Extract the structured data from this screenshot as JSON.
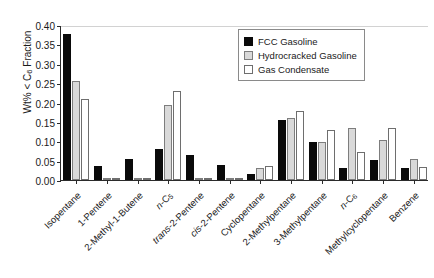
{
  "chart_data": {
    "type": "bar",
    "title": "",
    "xlabel": "",
    "ylabel": "Wt% < C6 Fraction",
    "ylabel_prefix": "Wt% < C",
    "ylabel_sub": "6",
    "ylabel_suffix": " Fraction",
    "ylim": [
      0.0,
      0.4
    ],
    "ytick_labels": [
      "0.00",
      "0.05",
      "0.10",
      "0.15",
      "0.20",
      "0.25",
      "0.30",
      "0.35",
      "0.40"
    ],
    "ytick_values": [
      0.0,
      0.05,
      0.1,
      0.15,
      0.2,
      0.25,
      0.3,
      0.35,
      0.4
    ],
    "grid": false,
    "legend_position": "top-right",
    "categories": [
      "Isopentane",
      "1-Pentene",
      "2-Methyl-1-Butene",
      "n-C5",
      "trans-2-Pentene",
      "cis-2-Pentene",
      "Cyclopentane",
      "2-Methylpentane",
      "3-Methylpentane",
      "n-C6",
      "Methylcyclopentane",
      "Benzene"
    ],
    "category_labels": [
      {
        "text": "Isopentane",
        "italic_prefix": "",
        "sub": ""
      },
      {
        "text": "1-Pentene",
        "italic_prefix": "",
        "sub": ""
      },
      {
        "text": "2-Methyl-1-Butene",
        "italic_prefix": "",
        "sub": ""
      },
      {
        "text": "n-C",
        "italic_prefix": "n",
        "sub": "5"
      },
      {
        "text": "trans-2-Pentene",
        "italic_prefix": "trans",
        "sub": ""
      },
      {
        "text": "cis-2-Pentene",
        "italic_prefix": "cis",
        "sub": ""
      },
      {
        "text": "Cyclopentane",
        "italic_prefix": "",
        "sub": ""
      },
      {
        "text": "2-Methylpentane",
        "italic_prefix": "",
        "sub": ""
      },
      {
        "text": "3-Methylpentane",
        "italic_prefix": "",
        "sub": ""
      },
      {
        "text": "n-C",
        "italic_prefix": "n",
        "sub": "6"
      },
      {
        "text": "Methylcyclopentane",
        "italic_prefix": "",
        "sub": ""
      },
      {
        "text": "Benzene",
        "italic_prefix": "",
        "sub": ""
      }
    ],
    "series": [
      {
        "name": "FCC Gasoline",
        "color": "#0a0a0a",
        "values": [
          0.378,
          0.035,
          0.053,
          0.08,
          0.065,
          0.039,
          0.016,
          0.155,
          0.098,
          0.03,
          0.051,
          0.032
        ]
      },
      {
        "name": "Hydrocracked Gasoline",
        "color": "#d9d9d9",
        "values": [
          0.255,
          0.002,
          0.002,
          0.193,
          0.002,
          0.0,
          0.03,
          0.159,
          0.098,
          0.133,
          0.103,
          0.053
        ]
      },
      {
        "name": "Gas Condensate",
        "color": "#ffffff",
        "values": [
          0.208,
          0.001,
          0.003,
          0.231,
          0.001,
          0.0,
          0.037,
          0.178,
          0.129,
          0.073,
          0.135,
          0.033
        ]
      }
    ]
  },
  "legend": {
    "items": [
      {
        "label": "FCC Gasoline",
        "swatch": "s0"
      },
      {
        "label": "Hydrocracked Gasoline",
        "swatch": "s1"
      },
      {
        "label": "Gas Condensate",
        "swatch": "s2"
      }
    ]
  }
}
